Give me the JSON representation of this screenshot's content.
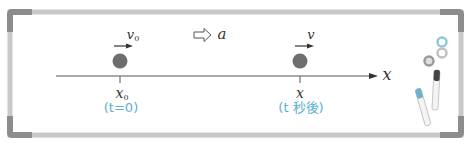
{
  "diagram": {
    "axis": {
      "label": "x"
    },
    "acceleration": {
      "icon": "hollow-right-arrow-icon",
      "label": "a"
    },
    "initial_state": {
      "velocity_label": "v",
      "velocity_sub": "0",
      "position_label": "x",
      "position_sub": "0",
      "time_caption": "(t=0)"
    },
    "later_state": {
      "velocity_label": "v",
      "position_label": "x",
      "time_caption": "(t 秒後)"
    },
    "colors": {
      "frame": "#bdbdbd",
      "frame_corner": "#8c8c8c",
      "ball": "#6e6e6e",
      "caption": "#5aaed0",
      "magnet_blue": "#8cc8e0"
    }
  }
}
